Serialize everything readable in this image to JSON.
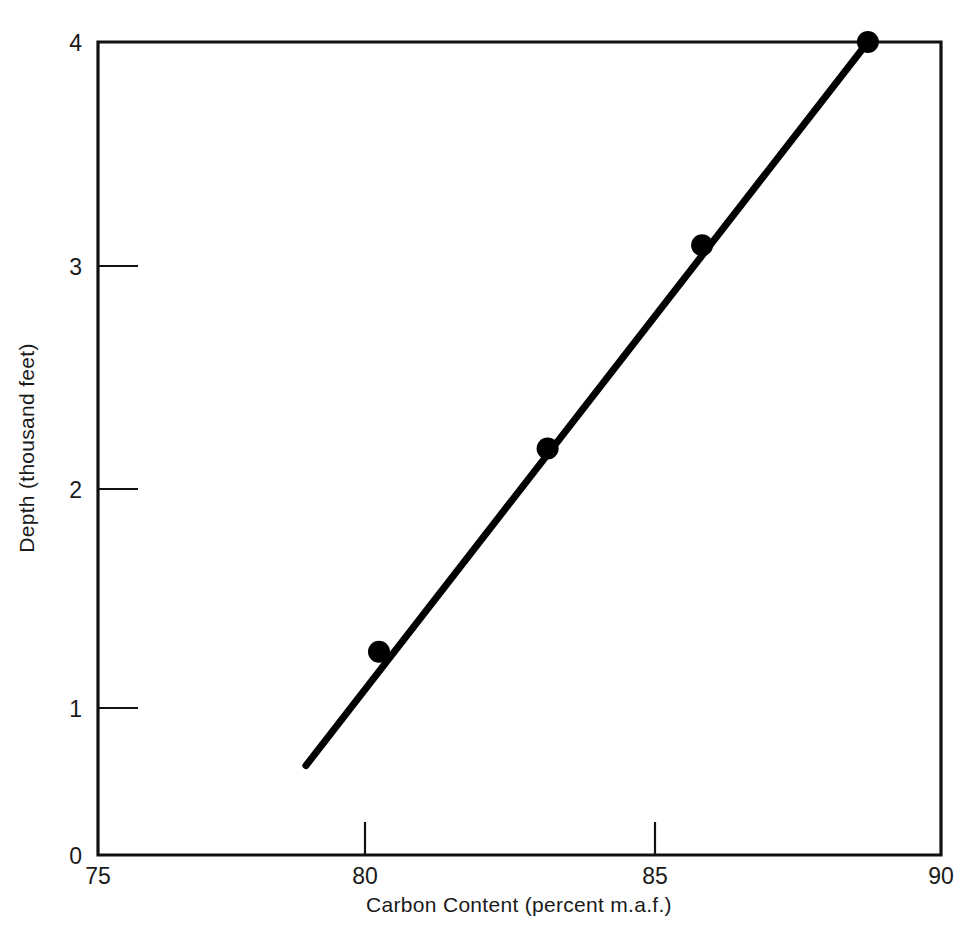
{
  "chart_data": {
    "type": "scatter",
    "title": "",
    "subtitle": "",
    "xlabel": "Carbon Content  (percent m.a.f.)",
    "ylabel": "Depth (thousand feet)",
    "xlim": [
      75,
      90
    ],
    "ylim": [
      0,
      4
    ],
    "xticks": [
      75,
      80,
      85,
      90
    ],
    "xtick_labels": [
      "75",
      "80",
      "85",
      "90"
    ],
    "yticks": [
      0,
      1,
      2,
      3,
      4
    ],
    "ytick_labels": [
      "0",
      "1",
      "2",
      "3",
      "4"
    ],
    "grid": false,
    "legend": null,
    "y_axis_inverted": false,
    "series": [
      {
        "name": "Measured coal samples",
        "marker": "filled-circle",
        "marker_color": "#000000",
        "x": [
          80.0,
          83.0,
          85.75,
          88.7
        ],
        "y": [
          1.0,
          2.0,
          3.0,
          4.0
        ]
      },
      {
        "name": "Fitted trend line",
        "marker": "none",
        "line_color": "#000000",
        "x": [
          78.7,
          88.7
        ],
        "y": [
          0.44,
          4.0
        ]
      }
    ],
    "annotations": []
  },
  "figure": {
    "background_color": "#ffffff",
    "axis_color": "#111111",
    "accent_color": "#000000"
  },
  "axes": {
    "x_label": "Carbon Content  (percent m.a.f.)",
    "y_label": "Depth (thousand feet)",
    "x_tick_75": "75",
    "x_tick_80": "80",
    "x_tick_85": "85",
    "x_tick_90": "90",
    "y_tick_0": "0",
    "y_tick_1": "1",
    "y_tick_2": "2",
    "y_tick_3": "3",
    "y_tick_4": "4"
  }
}
